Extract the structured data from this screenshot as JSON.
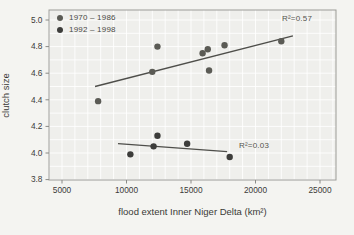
{
  "chart_data": {
    "type": "scatter",
    "xlabel": "flood extent Inner Niger Delta (km²)",
    "ylabel": "clutch size",
    "xlim": [
      4000,
      26300
    ],
    "ylim": [
      3.72,
      5.08
    ],
    "x_ticks": [
      5000,
      10000,
      15000,
      20000,
      25000
    ],
    "y_ticks": [
      3.8,
      4.0,
      4.2,
      4.4,
      4.6,
      4.8,
      5.0
    ],
    "grid": "minor grid every 1000 (x) and 0.1 (y), white lines on light panel",
    "legend_position": "top-left inside plot",
    "panel_color": "#efefec",
    "grid_color": "#ffffff",
    "frame_color": "#9b9b97",
    "tick_label_color": "#3b3b39",
    "trend_color": "#4e4e4a",
    "series": [
      {
        "name": "1970 – 1986",
        "color": "#5b5b55",
        "r2": "R²=0.57",
        "points": [
          [
            7800,
            4.39
          ],
          [
            12000,
            4.61
          ],
          [
            12400,
            4.8
          ],
          [
            15900,
            4.75
          ],
          [
            16300,
            4.78
          ],
          [
            16400,
            4.62
          ],
          [
            17600,
            4.81
          ],
          [
            22000,
            4.84
          ]
        ],
        "trend": {
          "x": [
            7560,
            22900
          ],
          "y": [
            4.5,
            4.88
          ]
        }
      },
      {
        "name": "1992 – 1998",
        "color": "#3d3d3b",
        "r2": "R²=0.03",
        "points": [
          [
            10300,
            3.99
          ],
          [
            12100,
            4.05
          ],
          [
            12400,
            4.13
          ],
          [
            14700,
            4.07
          ],
          [
            18000,
            3.97
          ]
        ],
        "trend": {
          "x": [
            9340,
            17800
          ],
          "y": [
            4.07,
            4.01
          ]
        }
      }
    ]
  }
}
